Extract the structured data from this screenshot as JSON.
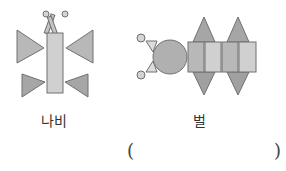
{
  "figures": [
    {
      "id": "butterfly",
      "label": "나비"
    },
    {
      "id": "bee",
      "label": "벌"
    }
  ],
  "answer": {
    "open": "(",
    "close": ")",
    "value": ""
  },
  "colors": {
    "stroke": "#707070",
    "dark": "#a6a6a6",
    "mid": "#b8b8b8",
    "light": "#d0d0d0"
  }
}
